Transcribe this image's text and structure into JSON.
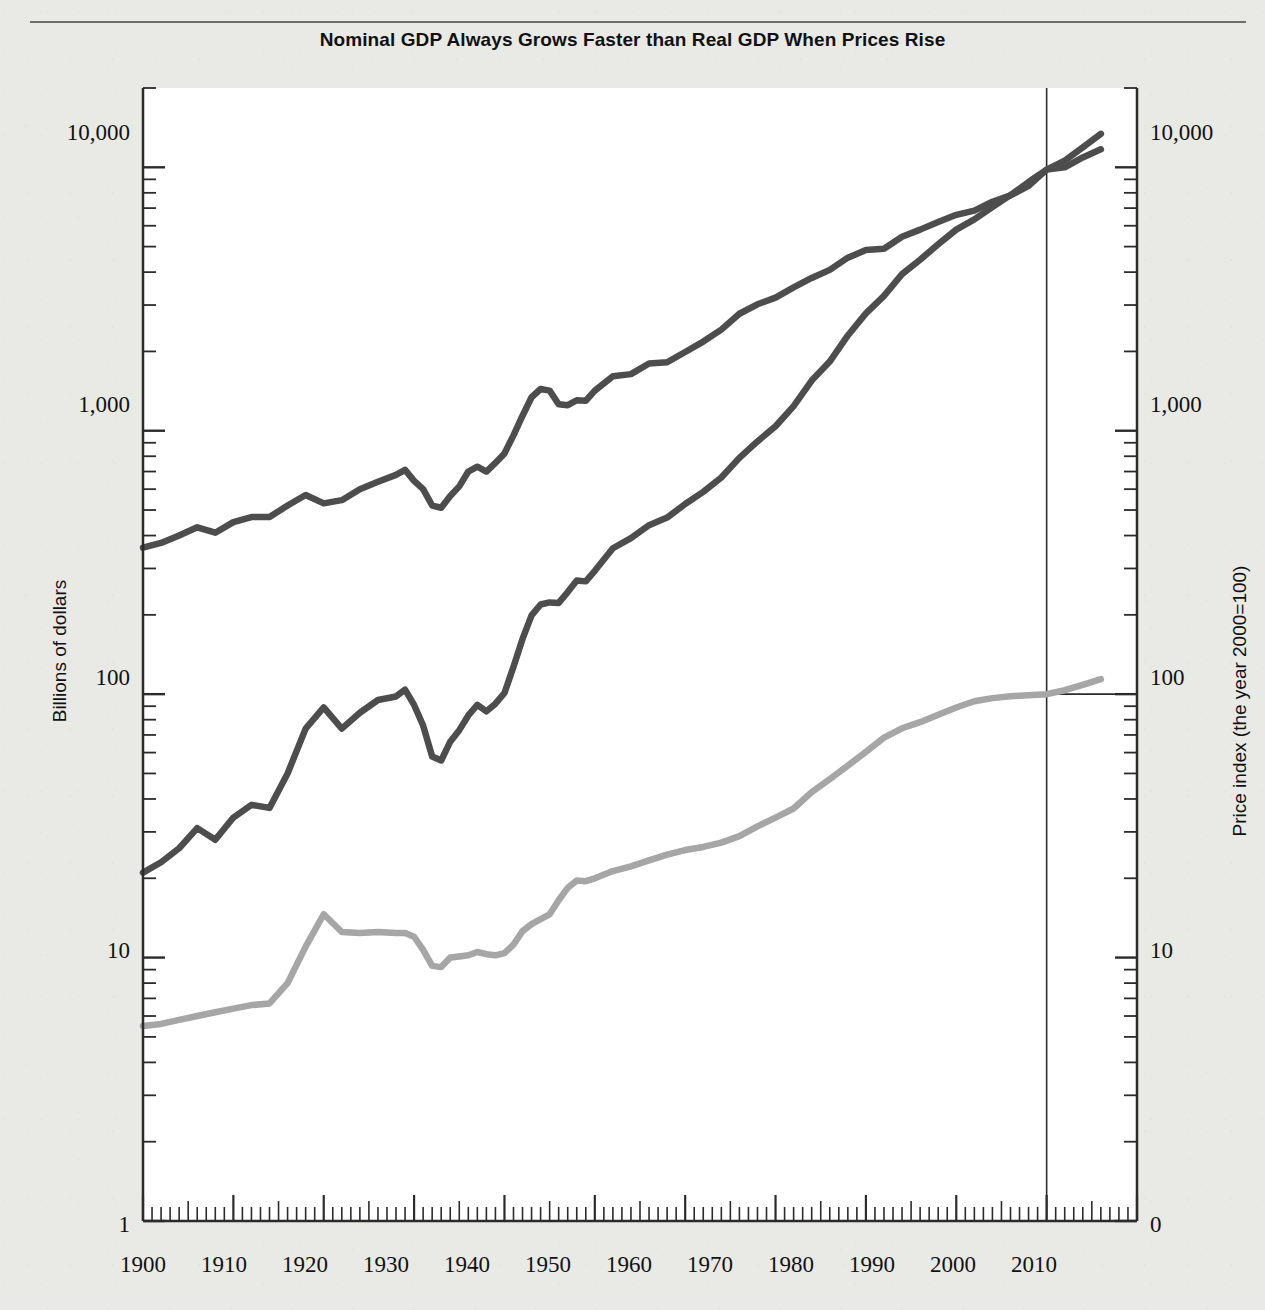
{
  "figure": {
    "title": "Nominal GDP Always Grows Faster than Real GDP When Prices Rise",
    "background_color": "#e9e9e6",
    "plot_background_color": "#ffffff"
  },
  "axes": {
    "left": {
      "title": "Billions of dollars",
      "scale": "log",
      "ticks": [
        "10,000",
        "1,000",
        "100",
        "10",
        "1"
      ]
    },
    "right": {
      "title": "Price index (the year 2000=100)",
      "scale": "log",
      "ticks": [
        "10,000",
        "1,000",
        "100",
        "10",
        "0"
      ]
    },
    "bottom": {
      "ticks": [
        "1900",
        "1910",
        "1920",
        "1930",
        "1940",
        "1950",
        "1960",
        "1970",
        "1980",
        "1990",
        "2000",
        "2010"
      ]
    }
  },
  "annotations": {
    "real_gdp_label": "Real GDP (left scale)",
    "nominal_gdp_label": "Nominal GDP (left scale)",
    "deflator_label": "Implicit GDP deflator (right scale)"
  },
  "colors": {
    "dark_series": "#4d4d4d",
    "light_series": "#a6a6a6",
    "axis": "#2b2b2b",
    "reference_line": "#2b2b2b"
  },
  "chart_data": {
    "type": "line",
    "title": "Nominal GDP Always Grows Faster than Real GDP When Prices Rise",
    "xlabel": "",
    "ylabel": "Billions of dollars",
    "y2label": "Price index (the year 2000=100)",
    "xlim": [
      1900,
      2010
    ],
    "ylim": [
      1,
      20000
    ],
    "y2lim": [
      1,
      20000
    ],
    "yscale": "log",
    "grid": false,
    "legend": "inline-annotations",
    "reference_lines": [
      {
        "orientation": "vertical",
        "x": 2000,
        "label": "year 2000"
      },
      {
        "orientation": "horizontal",
        "y2": 100,
        "label": "price index = 100",
        "x_from": 2000,
        "x_to": 2010
      }
    ],
    "x": [
      1900,
      1902,
      1904,
      1906,
      1908,
      1910,
      1912,
      1914,
      1916,
      1918,
      1920,
      1922,
      1924,
      1926,
      1928,
      1929,
      1930,
      1931,
      1932,
      1933,
      1934,
      1935,
      1936,
      1937,
      1938,
      1939,
      1940,
      1941,
      1942,
      1943,
      1944,
      1945,
      1946,
      1947,
      1948,
      1949,
      1950,
      1952,
      1954,
      1956,
      1958,
      1960,
      1962,
      1964,
      1966,
      1968,
      1970,
      1972,
      1974,
      1976,
      1978,
      1980,
      1982,
      1984,
      1986,
      1988,
      1990,
      1992,
      1994,
      1996,
      1998,
      2000,
      2002,
      2004,
      2006
    ],
    "series": [
      {
        "name": "Real GDP (left scale)",
        "axis": "left",
        "color": "#4d4d4d",
        "units": "billions of year-2000 dollars",
        "values": [
          360,
          375,
          400,
          430,
          410,
          450,
          470,
          470,
          520,
          570,
          530,
          545,
          600,
          640,
          680,
          710,
          645,
          600,
          520,
          510,
          565,
          615,
          700,
          730,
          700,
          755,
          820,
          960,
          1140,
          1340,
          1440,
          1420,
          1260,
          1250,
          1305,
          1300,
          1420,
          1610,
          1640,
          1800,
          1820,
          1990,
          2180,
          2420,
          2780,
          3020,
          3200,
          3500,
          3800,
          4080,
          4540,
          4850,
          4910,
          5450,
          5800,
          6200,
          6600,
          6850,
          7400,
          7820,
          8500,
          9800,
          10000,
          10900,
          11700
        ]
      },
      {
        "name": "Nominal GDP (left scale)",
        "axis": "left",
        "color": "#4d4d4d",
        "units": "billions of current dollars",
        "values": [
          21,
          23,
          26,
          31,
          28,
          34,
          38,
          37,
          50,
          74,
          89,
          74,
          85,
          95,
          98,
          104,
          91,
          76,
          58,
          56,
          66,
          73,
          83,
          91,
          86,
          92,
          101,
          127,
          162,
          199,
          219,
          223,
          222,
          244,
          270,
          268,
          294,
          358,
          391,
          438,
          468,
          527,
          586,
          664,
          789,
          911,
          1040,
          1240,
          1550,
          1830,
          2300,
          2790,
          3250,
          3930,
          4460,
          5100,
          5800,
          6340,
          7070,
          7840,
          8790,
          9800,
          10600,
          11900,
          13400
        ]
      },
      {
        "name": "Implicit GDP deflator (right scale)",
        "axis": "right",
        "color": "#a6a6a6",
        "units": "index, 2000 = 100",
        "values": [
          5.5,
          5.6,
          5.8,
          6.0,
          6.2,
          6.4,
          6.6,
          6.7,
          8.0,
          11.0,
          14.6,
          12.5,
          12.4,
          12.5,
          12.4,
          12.4,
          12.0,
          10.7,
          9.3,
          9.2,
          10.0,
          10.1,
          10.2,
          10.5,
          10.3,
          10.2,
          10.4,
          11.2,
          12.6,
          13.4,
          14.0,
          14.6,
          16.5,
          18.4,
          19.6,
          19.5,
          20.0,
          21.3,
          22.2,
          23.4,
          24.6,
          25.6,
          26.3,
          27.3,
          28.9,
          31.5,
          34.0,
          36.8,
          42.5,
          47.6,
          53.5,
          60.4,
          68.4,
          74.2,
          78.3,
          83.5,
          89.0,
          94.0,
          96.6,
          98.2,
          99.1,
          100.0,
          103.5,
          108.5,
          114.0
        ]
      }
    ]
  }
}
